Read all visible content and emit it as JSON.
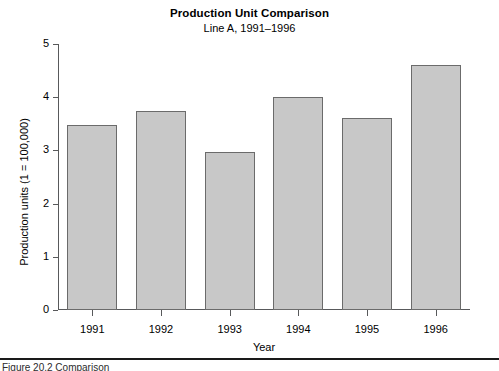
{
  "chart_data": {
    "type": "bar",
    "title": "Production Unit Comparison",
    "subtitle": "Line A, 1991–1996",
    "xlabel": "Year",
    "ylabel": "Production units (1 = 100,000)",
    "categories": [
      "1991",
      "1992",
      "1993",
      "1994",
      "1995",
      "1996"
    ],
    "values": [
      3.47,
      3.74,
      2.97,
      4.0,
      3.61,
      4.61
    ],
    "ylim": [
      0,
      5
    ],
    "yticks": [
      "0",
      "1",
      "2",
      "3",
      "4",
      "5"
    ],
    "ytick_values": [
      0,
      1,
      2,
      3,
      4,
      5
    ],
    "grid": false,
    "legend": "none",
    "bar_fill": "#c8c8c8",
    "bar_edge": "#6b6b6b",
    "axis_color": "#58595b"
  },
  "caption": {
    "text": "Figure 20.2  Comparison"
  }
}
